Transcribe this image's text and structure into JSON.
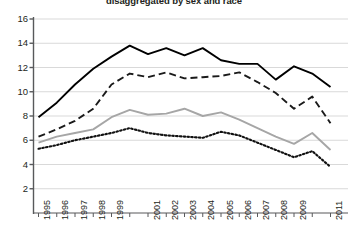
{
  "chart_data": {
    "type": "line",
    "title": "disaggregated by sex and race",
    "xlabel": "",
    "ylabel": "",
    "grid": true,
    "legend_position": "none",
    "xlim": [
      1995,
      2011
    ],
    "ylim": [
      0,
      16
    ],
    "yticks": [
      2,
      4,
      6,
      8,
      10,
      12,
      14,
      16
    ],
    "x": [
      1995,
      1996,
      1997,
      1998,
      1999,
      2000,
      2001,
      2002,
      2003,
      2004,
      2005,
      2006,
      2007,
      2008,
      2009,
      2010,
      2011
    ],
    "xtick_labels": [
      "1995",
      "1996",
      "1997",
      "1998",
      "1999",
      "",
      "2001",
      "2002",
      "2003",
      "2004",
      "2005",
      "2006",
      "2007",
      "2008",
      "2009",
      "",
      "2011"
    ],
    "series": [
      {
        "name": "series-solid-black",
        "style": "solid",
        "color": "#000000",
        "values": [
          7.9,
          9.1,
          10.6,
          11.9,
          12.9,
          13.8,
          13.1,
          13.6,
          13.0,
          13.6,
          12.6,
          12.3,
          12.3,
          11.0,
          12.1,
          11.5,
          10.4
        ]
      },
      {
        "name": "series-dashed-black",
        "style": "dashed",
        "color": "#1a1a1a",
        "values": [
          6.3,
          6.9,
          7.6,
          8.6,
          10.6,
          11.5,
          11.2,
          11.6,
          11.1,
          11.2,
          11.3,
          11.6,
          10.8,
          9.9,
          8.6,
          9.6,
          7.4
        ]
      },
      {
        "name": "series-solid-gray",
        "style": "solid",
        "color": "#a6a6a6",
        "values": [
          5.8,
          6.3,
          6.6,
          6.9,
          7.9,
          8.5,
          8.1,
          8.2,
          8.6,
          8.0,
          8.3,
          7.7,
          7.0,
          6.3,
          5.7,
          6.6,
          5.2
        ]
      },
      {
        "name": "series-dotted-black",
        "style": "dotted",
        "color": "#111111",
        "values": [
          5.3,
          5.6,
          6.0,
          6.3,
          6.6,
          7.0,
          6.6,
          6.4,
          6.3,
          6.2,
          6.7,
          6.4,
          5.8,
          5.2,
          4.6,
          5.1,
          3.8
        ]
      }
    ]
  },
  "axis": {
    "y_tick_labels": [
      "16",
      "14",
      "12",
      "10",
      "8",
      "6",
      "4",
      "2"
    ]
  }
}
